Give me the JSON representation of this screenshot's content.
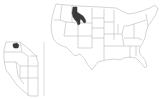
{
  "map": {
    "title": "",
    "type": "locator-map",
    "main_map": {
      "region": "United States (contiguous)",
      "highlight_color": "#3a3a3a",
      "border_color": "#b5b5b5",
      "fill_color": "#ffffff"
    },
    "inset_map": {
      "region": "Western United States",
      "highlight_color": "#3a3a3a",
      "border_color": "#b5b5b5"
    }
  }
}
